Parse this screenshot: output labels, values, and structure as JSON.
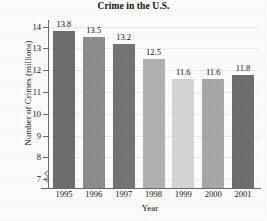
{
  "chart_data": {
    "type": "bar",
    "title": "Crime in the U.S.",
    "xlabel": "Year",
    "ylabel": "Number of Crimes (millions)",
    "categories": [
      "1995",
      "1996",
      "1997",
      "1998",
      "1999",
      "2000",
      "2001"
    ],
    "values": [
      13.8,
      13.5,
      13.2,
      12.5,
      11.6,
      11.6,
      11.8
    ],
    "value_labels": [
      "13.8",
      "13.5",
      "13.2",
      "12.5",
      "11.6",
      "11.6",
      "11.8"
    ],
    "ytick_labels": [
      "14",
      "13",
      "12",
      "11",
      "10",
      "9",
      "8",
      "7"
    ],
    "yticks": [
      14,
      13,
      12,
      11,
      10,
      9,
      8,
      7
    ],
    "ylim": [
      6.6,
      14.3
    ],
    "axis_break": true,
    "grid": true,
    "legend": null,
    "bar_colors": [
      "#6e6e6e",
      "#8d8d8d",
      "#757575",
      "#b2b2b2",
      "#d6d6d6",
      "#a8a8a8",
      "#6f6f6f"
    ],
    "axis_color": "#6a6a6a",
    "gridline_color": "#ececed",
    "text_color": "#141414"
  }
}
